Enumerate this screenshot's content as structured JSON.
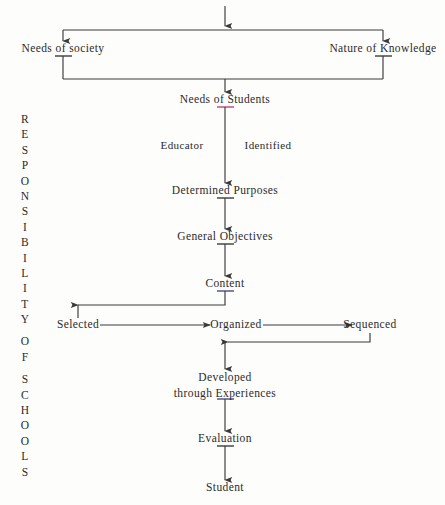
{
  "diagram": {
    "background_color": "#fdfdfc",
    "line_color": "#3a3a3a",
    "text_color": "#2b2b2b",
    "vertical_caption": {
      "words": [
        "RESPONSIBILITY",
        "OF",
        "SCHOOLS"
      ],
      "full_text": "RESPONSIBILITY OF SCHOOLS"
    },
    "nodes": {
      "needs_of_society": "Needs of society",
      "nature_of_knowledge": "Nature of Knowledge",
      "needs_of_students": "Needs of Students",
      "determined_purposes": "Determined Purposes",
      "general_objectives": "General  Objectives",
      "content": "Content",
      "selected": "Selected",
      "organized": "Organized",
      "sequenced": "Sequenced",
      "developed_line1": "Developed",
      "developed_line2": "through  Experiences",
      "evaluation": "Evaluation",
      "student": "Student"
    },
    "edge_labels": {
      "educator": "Educator",
      "identified": "Identified"
    }
  },
  "chart_data": {
    "type": "diagram",
    "nodes": [
      {
        "id": "source",
        "label": "",
        "x": 225,
        "y": 8
      },
      {
        "id": "needs_of_society",
        "label": "Needs of society",
        "x": 63,
        "y": 48
      },
      {
        "id": "nature_of_knowledge",
        "label": "Nature of Knowledge",
        "x": 383,
        "y": 48
      },
      {
        "id": "needs_of_students",
        "label": "Needs of Students",
        "x": 225,
        "y": 99
      },
      {
        "id": "determined_purposes",
        "label": "Determined Purposes",
        "x": 225,
        "y": 190
      },
      {
        "id": "general_objectives",
        "label": "General  Objectives",
        "x": 225,
        "y": 236
      },
      {
        "id": "content",
        "label": "Content",
        "x": 225,
        "y": 283
      },
      {
        "id": "selected",
        "label": "Selected",
        "x": 78,
        "y": 327
      },
      {
        "id": "organized",
        "label": "Organized",
        "x": 225,
        "y": 327
      },
      {
        "id": "sequenced",
        "label": "Sequenced",
        "x": 370,
        "y": 327
      },
      {
        "id": "developed",
        "label": "Developed through  Experiences",
        "x": 225,
        "y": 383
      },
      {
        "id": "evaluation",
        "label": "Evaluation",
        "x": 225,
        "y": 438
      },
      {
        "id": "student",
        "label": "Student",
        "x": 225,
        "y": 487
      }
    ],
    "edges": [
      {
        "from": "source",
        "to": "needs_of_society",
        "label": ""
      },
      {
        "from": "source",
        "to": "nature_of_knowledge",
        "label": ""
      },
      {
        "from": "needs_of_society",
        "to": "needs_of_students",
        "label": ""
      },
      {
        "from": "nature_of_knowledge",
        "to": "needs_of_students",
        "label": ""
      },
      {
        "from": "needs_of_students",
        "to": "determined_purposes",
        "label": "Educator / Identified"
      },
      {
        "from": "determined_purposes",
        "to": "general_objectives",
        "label": ""
      },
      {
        "from": "general_objectives",
        "to": "content",
        "label": ""
      },
      {
        "from": "content",
        "to": "selected",
        "label": ""
      },
      {
        "from": "selected",
        "to": "organized",
        "label": ""
      },
      {
        "from": "organized",
        "to": "sequenced",
        "label": ""
      },
      {
        "from": "sequenced",
        "to": "developed",
        "label": ""
      },
      {
        "from": "developed",
        "to": "evaluation",
        "label": ""
      },
      {
        "from": "evaluation",
        "to": "student",
        "label": ""
      }
    ],
    "annotations": [
      "RESPONSIBILITY OF SCHOOLS"
    ]
  }
}
